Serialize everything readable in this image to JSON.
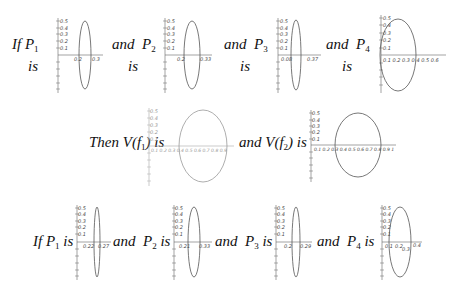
{
  "row1": {
    "items": [
      {
        "prefix": "If",
        "var": "P",
        "sub": "1",
        "suffix": "is",
        "x_ticks": [
          "0.2",
          "0.3"
        ],
        "y_ticks": [
          "0.5",
          "0.4",
          "0.3",
          "0.2",
          "0.1"
        ]
      },
      {
        "prefix": "and",
        "var": "P",
        "sub": "2",
        "suffix": "is",
        "x_ticks": [
          "0.2",
          "0.33"
        ],
        "y_ticks": [
          "0.5",
          "0.4",
          "0.3",
          "0.2",
          "0.1"
        ]
      },
      {
        "prefix": "and",
        "var": "P",
        "sub": "3",
        "suffix": "is",
        "x_ticks": [
          "0.08",
          "0.37"
        ],
        "y_ticks": [
          "0.5",
          "0.4",
          "0.3",
          "0.2",
          "0.1"
        ]
      },
      {
        "prefix": "and",
        "var": "P",
        "sub": "4",
        "suffix": "is",
        "x_ticks": [
          "0.1",
          "0.2",
          "0.3",
          "0.4",
          "0.5",
          "0.6"
        ],
        "y_ticks": [
          "0.5",
          "0.4",
          "0.3",
          "0.2",
          "0.1"
        ]
      }
    ]
  },
  "row2": {
    "items": [
      {
        "prefix": "Then",
        "func": "V(f",
        "sub": "1",
        "suffix": ") is",
        "x_ticks": [
          "0.1",
          "0.2",
          "0.3",
          "0.4",
          "0.5",
          "0.6",
          "0.7",
          "0.8",
          "0.9"
        ],
        "y_ticks": [
          "0.5",
          "0.4",
          "0.3",
          "0.2",
          "0.1"
        ]
      },
      {
        "prefix": "and",
        "func": "V(f",
        "sub": "2",
        "suffix": ") is",
        "x_ticks": [
          "0.1",
          "0.2",
          "0.3",
          "0.4",
          "0.5",
          "0.6",
          "0.7",
          "0.8",
          "0.9",
          "1"
        ],
        "y_ticks": [
          "0.5",
          "0.4",
          "0.3",
          "0.2",
          "0.1"
        ]
      }
    ]
  },
  "row3": {
    "items": [
      {
        "prefix": "If",
        "var": "P",
        "sub": "1",
        "suffix": "is",
        "x_ticks": [
          "0.22",
          "0.27"
        ],
        "y_ticks": [
          "0.5",
          "0.4",
          "0.3",
          "0.2",
          "0.1"
        ]
      },
      {
        "prefix": "and",
        "var": "P",
        "sub": "2",
        "suffix": "is",
        "x_ticks": [
          "0.21",
          "0.33"
        ],
        "y_ticks": [
          "0.5",
          "0.4",
          "0.3",
          "0.2",
          "0.1"
        ]
      },
      {
        "prefix": "and",
        "var": "P",
        "sub": "3",
        "suffix": "is",
        "x_ticks": [
          "0.2",
          "0.29"
        ],
        "y_ticks": [
          "0.5",
          "0.4",
          "0.3",
          "0.2",
          "0.1"
        ]
      },
      {
        "prefix": "and",
        "var": "P",
        "sub": "4",
        "suffix": "is",
        "x_ticks": [
          "0.1",
          "0.2",
          "0.3",
          "0.4"
        ],
        "y_ticks": [
          "0.5",
          "0.4",
          "0.3",
          "0.2",
          "0.1"
        ]
      }
    ]
  },
  "colors": {
    "curve": "#555555",
    "curve_light": "#9a9a9a",
    "axis": "#555555"
  }
}
